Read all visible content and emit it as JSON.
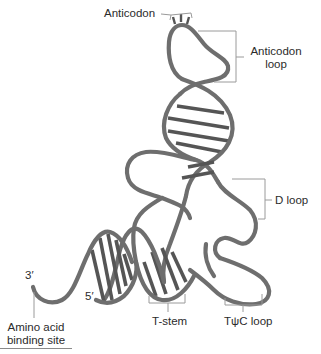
{
  "diagram": {
    "strand_color": "#6e6e6e",
    "bracket_color": "#9a9a9a",
    "labels": {
      "anticodon": "Anticodon",
      "anticodon_loop_line1": "Anticodon",
      "anticodon_loop_line2": "loop",
      "d_loop": "D loop",
      "three_prime": "3′",
      "five_prime": "5′",
      "amino_acid_line1": "Amino acid",
      "amino_acid_line2": "binding site",
      "t_stem": "T-stem",
      "tpsic_loop": "TψC loop"
    }
  }
}
